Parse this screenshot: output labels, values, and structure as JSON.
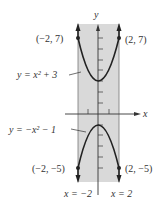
{
  "axes": {
    "x_label": "x",
    "y_label": "y"
  },
  "curves": [
    {
      "equation_label": "y = x² + 3",
      "expr": "x^2+3"
    },
    {
      "equation_label": "y = −x² − 1",
      "expr": "-x^2-1"
    }
  ],
  "points": [
    {
      "label": "(−2, 7)"
    },
    {
      "label": "(2, 7)"
    },
    {
      "label": "(−2, −5)"
    },
    {
      "label": "(2, −5)"
    }
  ],
  "vertical_lines": [
    {
      "label": "x = −2"
    },
    {
      "label": "x = 2"
    }
  ],
  "colors": {
    "shade": "#d6d6d6",
    "curve": "#222222",
    "axis": "#333333"
  }
}
